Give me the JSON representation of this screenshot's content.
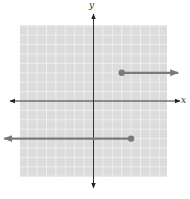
{
  "chart_data": {
    "type": "line",
    "title": "",
    "xlabel": "x",
    "ylabel": "y",
    "xlim": [
      -8,
      8
    ],
    "ylim": [
      -8,
      8
    ],
    "grid": true,
    "legend": null,
    "series": [
      {
        "name": "upper ray",
        "description": "Closed dot at (3, 3), ray extending right (y = 3 for x >= 3)",
        "points": [
          [
            3,
            3
          ],
          [
            9,
            3
          ]
        ],
        "start_marker": "closed-dot",
        "end_marker": "arrow"
      },
      {
        "name": "lower ray",
        "description": "Closed dot at (4, -4), ray extending left (y = -4 for x <= 4)",
        "points": [
          [
            4,
            -4
          ],
          [
            -9.5,
            -4
          ]
        ],
        "start_marker": "closed-dot",
        "end_marker": "arrow"
      }
    ]
  },
  "colors": {
    "grid_background": "#dcdcdc",
    "grid_lines": "#f2f2f2",
    "axes": "#333333",
    "series": "#7a7a7a"
  },
  "labels": {
    "x_axis": "x",
    "y_axis": "y"
  }
}
